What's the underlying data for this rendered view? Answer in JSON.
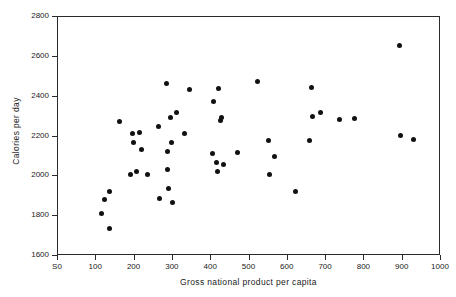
{
  "chart_data": {
    "type": "scatter",
    "title": "",
    "xlabel": "Gross national product per capita",
    "ylabel": "Calories per day",
    "xlim": [
      0,
      1000
    ],
    "ylim": [
      1600,
      2800
    ],
    "xticks": [
      "S0",
      "100",
      "200",
      "300",
      "400",
      "500",
      "600",
      "700",
      "800",
      "900",
      "1000"
    ],
    "xtick_values": [
      0,
      100,
      200,
      300,
      400,
      500,
      600,
      700,
      800,
      900,
      1000
    ],
    "yticks": [
      "1600",
      "1800",
      "2000",
      "2200",
      "2400",
      "2600",
      "2800"
    ],
    "ytick_values": [
      1600,
      1800,
      2000,
      2200,
      2400,
      2600,
      2800
    ],
    "grid": false,
    "legend": null,
    "marker": "filled-circle",
    "marker_color": "#111111",
    "points": [
      {
        "x": 117,
        "y": 1806
      },
      {
        "x": 124,
        "y": 1878
      },
      {
        "x": 136,
        "y": 1920
      },
      {
        "x": 138,
        "y": 1733
      },
      {
        "x": 163,
        "y": 2270
      },
      {
        "x": 192,
        "y": 2004
      },
      {
        "x": 196,
        "y": 2209
      },
      {
        "x": 201,
        "y": 2164
      },
      {
        "x": 207,
        "y": 2020
      },
      {
        "x": 216,
        "y": 2213
      },
      {
        "x": 220,
        "y": 2129
      },
      {
        "x": 237,
        "y": 2003
      },
      {
        "x": 266,
        "y": 2245
      },
      {
        "x": 268,
        "y": 1884
      },
      {
        "x": 287,
        "y": 2459
      },
      {
        "x": 288,
        "y": 2027
      },
      {
        "x": 289,
        "y": 2119
      },
      {
        "x": 292,
        "y": 1934
      },
      {
        "x": 297,
        "y": 2291
      },
      {
        "x": 300,
        "y": 2164
      },
      {
        "x": 302,
        "y": 1864
      },
      {
        "x": 311,
        "y": 2314
      },
      {
        "x": 333,
        "y": 2210
      },
      {
        "x": 347,
        "y": 2431
      },
      {
        "x": 405,
        "y": 2111
      },
      {
        "x": 409,
        "y": 2372
      },
      {
        "x": 417,
        "y": 2062
      },
      {
        "x": 420,
        "y": 2021
      },
      {
        "x": 422,
        "y": 2436
      },
      {
        "x": 427,
        "y": 2275
      },
      {
        "x": 429,
        "y": 2292
      },
      {
        "x": 436,
        "y": 2052
      },
      {
        "x": 470,
        "y": 2117
      },
      {
        "x": 523,
        "y": 2470
      },
      {
        "x": 553,
        "y": 2177
      },
      {
        "x": 556,
        "y": 2004
      },
      {
        "x": 567,
        "y": 2096
      },
      {
        "x": 624,
        "y": 1921
      },
      {
        "x": 659,
        "y": 2174
      },
      {
        "x": 664,
        "y": 2441
      },
      {
        "x": 667,
        "y": 2295
      },
      {
        "x": 688,
        "y": 2317
      },
      {
        "x": 737,
        "y": 2280
      },
      {
        "x": 777,
        "y": 2285
      },
      {
        "x": 895,
        "y": 2653
      },
      {
        "x": 897,
        "y": 2200
      },
      {
        "x": 930,
        "y": 2181
      }
    ]
  }
}
